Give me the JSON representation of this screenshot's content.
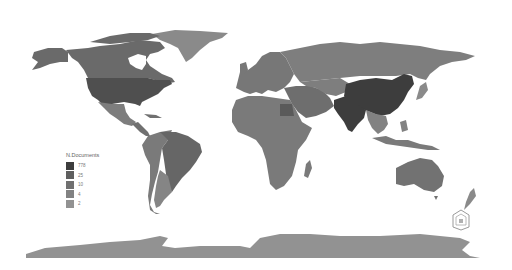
{
  "map": {
    "type": "choropleth-world",
    "projection": "equirectangular",
    "background": "#ffffff"
  },
  "legend": {
    "title": "N.Documents",
    "items": [
      {
        "label": "778",
        "color": "#3d3d3d"
      },
      {
        "label": "25",
        "color": "#5f5f5f"
      },
      {
        "label": "10",
        "color": "#707070"
      },
      {
        "label": "4",
        "color": "#828282"
      },
      {
        "label": "2",
        "color": "#929292"
      }
    ]
  },
  "regions": {
    "china": "#3d3d3d",
    "india": "#3d3d3d",
    "usa": "#4f4f4f",
    "canada": "#6a6a6a",
    "alaska": "#6a6a6a",
    "greenland": "#8a8a8a",
    "mexico": "#7d7d7d",
    "central_america": "#707070",
    "brazil": "#666666",
    "south_america_west": "#7a7a7a",
    "argentina": "#858585",
    "europe": "#777777",
    "russia": "#7e7e7e",
    "middle_east": "#6e6e6e",
    "egypt": "#5a5a5a",
    "africa": "#7a7a7a",
    "southeast_asia": "#828282",
    "indonesia": "#7a7a7a",
    "australia": "#727272",
    "new_zealand": "#8a8a8a",
    "antarctica": "#929292",
    "japan": "#8a8a8a"
  },
  "logo": {
    "name": "publisher-logo"
  }
}
